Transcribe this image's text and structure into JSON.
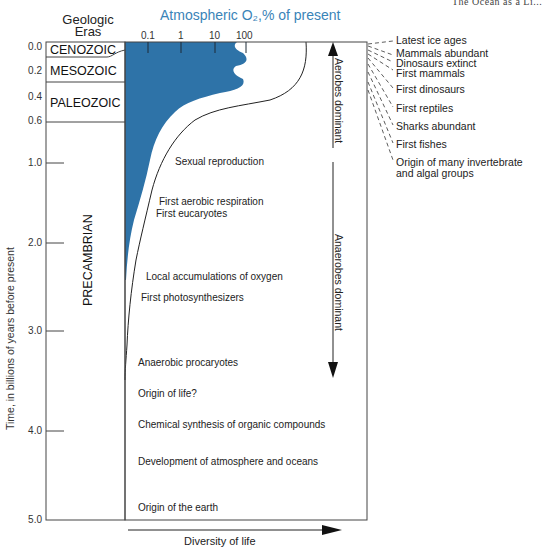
{
  "header": {
    "eras_title_line1": "Geologic",
    "eras_title_line2": "Eras",
    "o2_axis_title": "Atmospheric O₂,% of present",
    "clipped_corner_text": "The Ocean as a Li..."
  },
  "o2_axis": {
    "ticks": [
      "0.1",
      "1",
      "10",
      "100"
    ],
    "fill_color": "#2e73a8"
  },
  "y_axis": {
    "label": "Time, in billions of years before present",
    "ticks_upper": [
      "0.0",
      "0.2",
      "0.4",
      "0.6"
    ],
    "ticks_lower": [
      "1.0",
      "2.0",
      "3.0",
      "4.0",
      "5.0"
    ]
  },
  "eras": [
    {
      "name": "CENOZOIC"
    },
    {
      "name": "MESOZOIC"
    },
    {
      "name": "PALEOZOIC"
    },
    {
      "name": "PRECAMBRIAN"
    }
  ],
  "events": [
    "Sexual reproduction",
    "First aerobic respiration",
    "First eucaryotes",
    "Local accumulations of oxygen",
    "First photosynthesizers",
    "Anaerobic procaryotes",
    "Origin of life?",
    "Chemical synthesis of organic compounds",
    "Development of atmosphere and oceans",
    "Origin of the earth"
  ],
  "dominance": {
    "aerobes": "Aerobes dominant",
    "anaerobes": "Anaerobes dominant"
  },
  "x_axis": {
    "label": "Diversity of life"
  },
  "phanerozoic_events": [
    "Latest ice ages",
    "Mammals abundant",
    "Dinosaurs extinct",
    "First mammals",
    "First dinosaurs",
    "First reptiles",
    "Sharks abundant",
    "First fishes",
    "Origin of many invertebrate",
    "and algal groups"
  ]
}
